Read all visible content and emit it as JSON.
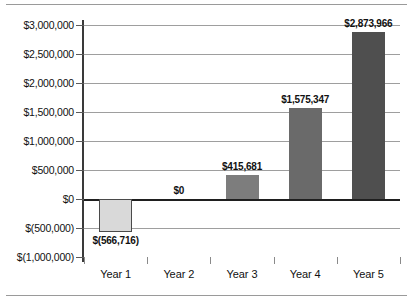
{
  "chart_data": {
    "type": "bar",
    "title": "",
    "subtitle": "",
    "xlabel": "",
    "ylabel": "",
    "categories": [
      "Year 1",
      "Year 2",
      "Year 3",
      "Year 4",
      "Year 5"
    ],
    "values": [
      -566716,
      0,
      415681,
      1575347,
      2873966
    ],
    "data_labels": [
      "$(566,716)",
      "$0",
      "$415,681",
      "$1,575,347",
      "$2,873,966"
    ],
    "bar_colors": [
      "#d9d9d9",
      "#9a9a9a",
      "#7d7d7d",
      "#6a6a6a",
      "#4f4f4f"
    ],
    "ylim": [
      -1000000,
      3000000
    ],
    "ytick_values": [
      3000000,
      2500000,
      2000000,
      1500000,
      1000000,
      500000,
      0,
      -500000,
      -1000000
    ],
    "ytick_labels": [
      "$3,000,000",
      "$2,500,000",
      "$2,000,000",
      "$1,500,000",
      "$1,000,000",
      "$500,000",
      "$0",
      "$(500,000)",
      "$(1,000,000)"
    ],
    "grid": true,
    "grid_axis": "y",
    "legend": false,
    "legend_position": "none",
    "negative_format": "parentheses",
    "currency_symbol": "$",
    "zero_line_color": "#1f1f1f",
    "gridline_color": "#9e9e9e",
    "axis_color": "#3a3a3a"
  }
}
